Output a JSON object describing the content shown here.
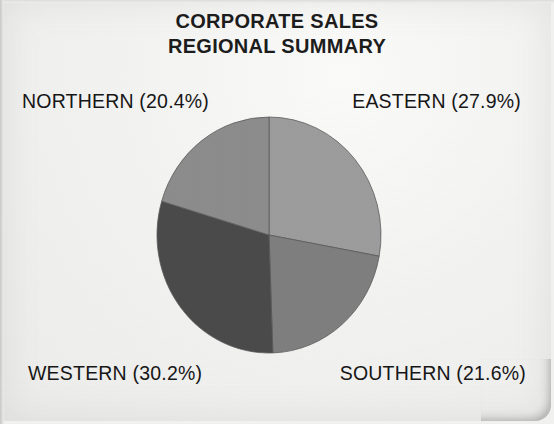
{
  "document": {
    "title_line_1": "CORPORATE SALES",
    "title_line_2": "REGIONAL SUMMARY"
  },
  "labels": {
    "northern": "NORTHERN (20.4%)",
    "eastern": "EASTERN (27.9%)",
    "western": "WESTERN (30.2%)",
    "southern": "SOUTHERN (21.6%)"
  },
  "colors": {
    "background": "#f2f2f1",
    "text": "#161616",
    "northern": "#8c8c8c",
    "eastern": "#9c9c9c",
    "southern": "#7e7e7e",
    "western": "#4a4a4a",
    "slice_outline": "#5a5a5a"
  },
  "chart_data": {
    "type": "pie",
    "title": "CORPORATE SALES REGIONAL SUMMARY",
    "categories": [
      "EASTERN",
      "SOUTHERN",
      "WESTERN",
      "NORTHERN"
    ],
    "values": [
      27.9,
      21.6,
      30.2,
      20.4
    ],
    "value_unit": "%",
    "labels": [
      "EASTERN (27.9%)",
      "SOUTHERN (21.6%)",
      "WESTERN (30.2%)",
      "NORTHERN (20.4%)"
    ],
    "slice_colors": [
      "#9c9c9c",
      "#7e7e7e",
      "#4a4a4a",
      "#8c8c8c"
    ],
    "start_angle_deg": 0,
    "direction": "clockwise",
    "legend": "none",
    "grid": false,
    "label_positions": [
      "top-right",
      "bottom-right",
      "bottom-left",
      "top-left"
    ],
    "center": {
      "x": 269,
      "y": 235
    },
    "radius": 112
  }
}
